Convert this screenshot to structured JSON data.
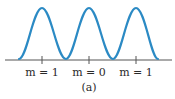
{
  "figure": {
    "caption": "(a)",
    "curve_color": "#2b8ac4",
    "axis_color": "#555555",
    "labels": [
      {
        "text": "m = 1",
        "x": 42
      },
      {
        "text": "m = 0",
        "x": 89
      },
      {
        "text": "m = 1",
        "x": 136
      }
    ],
    "peaks": 3
  }
}
